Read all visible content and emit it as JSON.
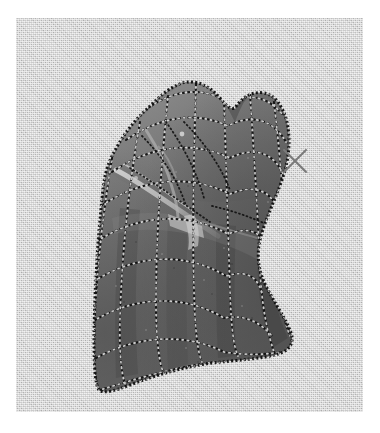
{
  "figure": {
    "kind": "3d-mesh-surface-render",
    "background_color": "#c9c9c9",
    "margin_color": "#ffffff",
    "panel": {
      "x": 16,
      "y": 18,
      "width": 347,
      "height": 394
    }
  },
  "surface": {
    "name": "draped-cloth-mesh",
    "fill_color": "#6b6b6b",
    "shadow_color": "#4a4a4a",
    "highlight_color": "#b9b9b9",
    "outline_color": "#1d1d1d",
    "mesh_line_dark": "#111111",
    "mesh_line_light": "#e6e6e6",
    "bounds": {
      "x": 80,
      "y": 64,
      "width": 205,
      "height": 310
    },
    "outline_path": "M 86 180 L 94 146 L 112 116 L 133 88 L 152 70 L 174 64 L 196 72 L 214 88 L 231 74 L 250 76 L 265 92 L 272 118 L 270 152 L 258 186 L 247 214 L 243 240 L 250 262 L 262 282 L 272 300 L 276 318 L 268 330 L 246 336 L 214 340 L 176 348 L 140 360 L 108 372 L 86 374 L 80 352 L 78 316 L 80 276 L 82 236 Z",
    "crease_path": "M 104 150 L 130 168 L 158 190 L 180 206 L 196 216",
    "crease2_path": "M 128 120 L 146 140 L 160 162 L 168 186",
    "fold_band_path": "M 96 178 L 136 168 L 178 176 L 214 190 L 244 206 L 262 214"
  },
  "mesh_grid": {
    "u_lines": 9,
    "v_lines": 9,
    "style": "dotted",
    "dash_pattern": "1 3"
  },
  "axis_marker": {
    "name": "x-axis-cross",
    "label": "X",
    "color": "#7a7a7a",
    "x": 295,
    "y": 161,
    "size": 22,
    "stroke_width": 2
  },
  "chart_data": {
    "type": "scatter",
    "title": "",
    "xlabel": "",
    "ylabel": "",
    "note": "Rendered 3D mesh surface; no numeric axes or tick labels are present in the figure.",
    "series": [
      {
        "name": "mesh-vertices",
        "values": []
      }
    ]
  }
}
